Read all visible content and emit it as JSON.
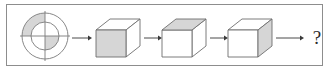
{
  "figure": {
    "type": "visual-analogy-sequence",
    "border_color": "#8d8d8d",
    "background_color": "#ffffff",
    "stroke_color": "#6e6e6e",
    "shade_color": "#d6d6d6",
    "arrow_color": "#4a4a4a",
    "unknown_label": "?",
    "sequence_length": 5
  },
  "items": [
    {
      "index": 1,
      "name": "quartered-annulus",
      "shape": "concentric-circles",
      "outer_radius": 23,
      "inner_radius": 14,
      "center_x": 45,
      "center_y": 36,
      "divider_axes": [
        "vertical",
        "horizontal"
      ],
      "shaded_regions": [
        "outer-ring-top-left",
        "inner-circle-bottom-right"
      ],
      "shaded_face": "none"
    },
    {
      "index": 2,
      "name": "cube-front-shaded",
      "shape": "isometric-cube",
      "shaded_face": "front",
      "white_faces": [
        "top",
        "right"
      ],
      "center_x": 112,
      "center_y": 38
    },
    {
      "index": 3,
      "name": "cube-top-shaded",
      "shape": "isometric-cube",
      "shaded_face": "top",
      "white_faces": [
        "front",
        "right"
      ],
      "center_x": 178,
      "center_y": 38
    },
    {
      "index": 4,
      "name": "cube-right-shaded",
      "shape": "isometric-cube",
      "shaded_face": "right",
      "white_faces": [
        "front",
        "top"
      ],
      "center_x": 244,
      "center_y": 38
    },
    {
      "index": 5,
      "name": "unknown-answer",
      "shape": "question-mark",
      "label": "?",
      "center_x": 316,
      "center_y": 38
    }
  ],
  "arrows": [
    {
      "index": 1,
      "name": "arrow-1",
      "x1": 72,
      "x2": 90,
      "y": 38
    },
    {
      "index": 2,
      "name": "arrow-2",
      "x1": 138,
      "x2": 156,
      "y": 38
    },
    {
      "index": 3,
      "name": "arrow-3",
      "x1": 204,
      "x2": 222,
      "y": 38
    },
    {
      "index": 4,
      "name": "arrow-4",
      "x1": 272,
      "x2": 302,
      "y": 38
    }
  ]
}
